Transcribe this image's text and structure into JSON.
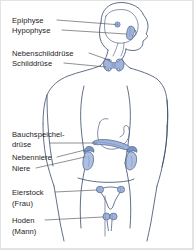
{
  "figure": {
    "language": "de",
    "background_color": "#ffffff",
    "border_color": "#e3e3e3",
    "outline_color": "#3a4a6b",
    "organ_fill_color": "#9fb4dc",
    "organ_fill_light": "#c3d0e8",
    "organ_stroke_color": "#5a6f9e",
    "leader_line_color": "#555555",
    "text_color": "#1c1c1c"
  },
  "labels": [
    {
      "id": "epiphyse",
      "text": "Epiphyse",
      "x": 12,
      "y": 16
    },
    {
      "id": "hypophyse",
      "text": "Hypophyse",
      "x": 12,
      "y": 26
    },
    {
      "id": "nebenschilddruese",
      "text": "Nebenschilddrüse",
      "x": 12,
      "y": 49
    },
    {
      "id": "schilddruese",
      "text": "Schilddrüse",
      "x": 12,
      "y": 59
    },
    {
      "id": "bauchspeichel",
      "text": "Bauchspeichel-",
      "x": 12,
      "y": 130
    },
    {
      "id": "druese",
      "text": "drüse",
      "x": 12,
      "y": 140
    },
    {
      "id": "nebenniere",
      "text": "Nebenniere",
      "x": 12,
      "y": 153
    },
    {
      "id": "niere",
      "text": "Niere",
      "x": 12,
      "y": 164
    },
    {
      "id": "eierstock",
      "text": "Eierstock",
      "x": 12,
      "y": 188
    },
    {
      "id": "frau",
      "text": "(Frau)",
      "x": 12,
      "y": 199
    },
    {
      "id": "hoden",
      "text": "Hoden",
      "x": 12,
      "y": 216
    },
    {
      "id": "mann",
      "text": "(Mann)",
      "x": 12,
      "y": 227
    }
  ],
  "organs": [
    {
      "id": "epiphyse",
      "name": "Epiphyse (Zirbeldrüse)"
    },
    {
      "id": "hypophyse",
      "name": "Hypophyse (Hirnanhangsdrüse)"
    },
    {
      "id": "nebenschilddruese",
      "name": "Nebenschilddrüse"
    },
    {
      "id": "schilddruese",
      "name": "Schilddrüse"
    },
    {
      "id": "bauchspeicheldruese",
      "name": "Bauchspeicheldrüse"
    },
    {
      "id": "nebenniere",
      "name": "Nebenniere"
    },
    {
      "id": "niere",
      "name": "Niere"
    },
    {
      "id": "eierstock",
      "name": "Eierstock"
    },
    {
      "id": "hoden",
      "name": "Hoden"
    }
  ]
}
